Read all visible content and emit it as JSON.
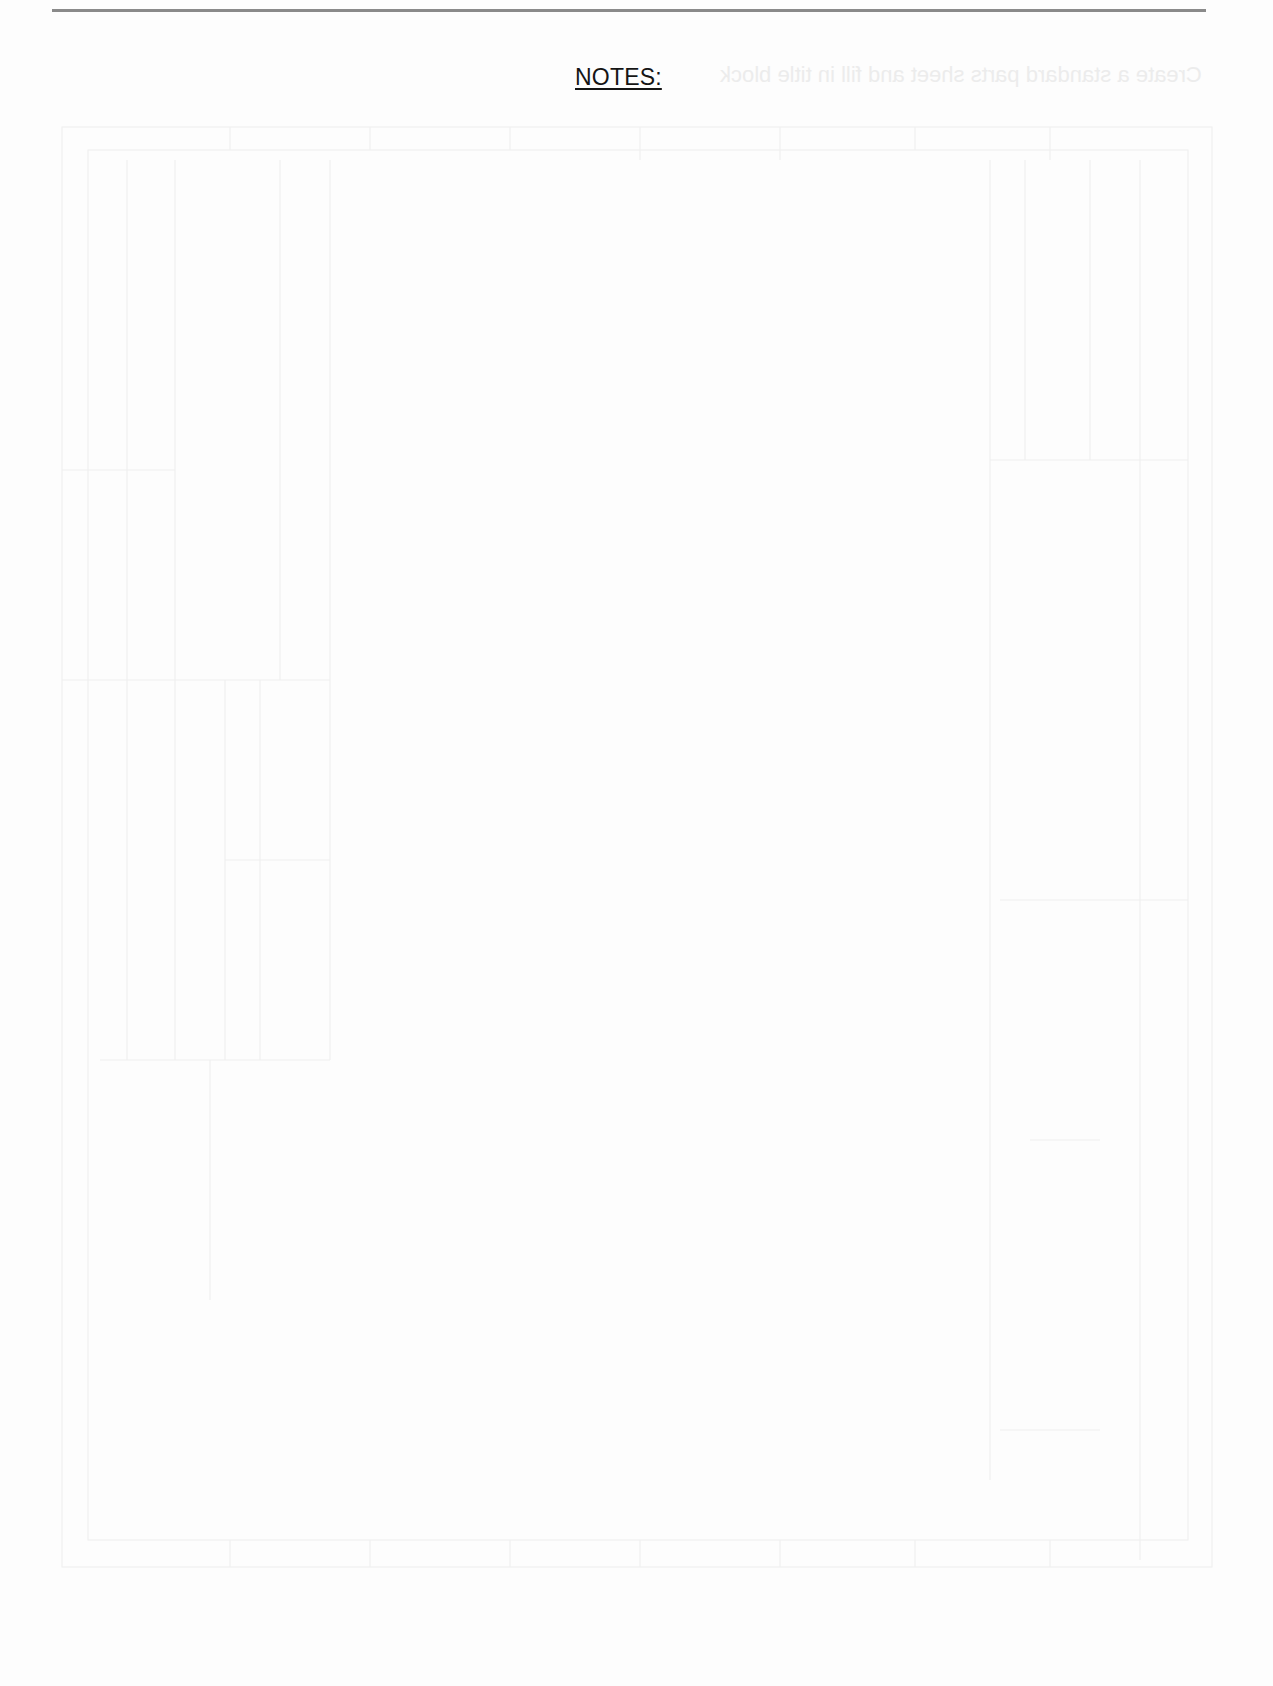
{
  "document": {
    "heading": "NOTES:",
    "colors": {
      "rule": "#8a8a8a",
      "heading_text": "#151515",
      "background": "#fdfdfd",
      "ghost": "#ececec"
    },
    "bleed_through": {
      "mirrored_text": "Create a standard parts sheet and fill in title block"
    }
  }
}
